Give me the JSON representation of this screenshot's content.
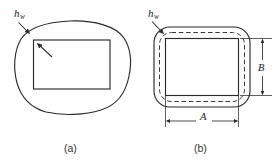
{
  "figure": {
    "type": "engineering-cross-section-diagram",
    "background_color": "#ffffff",
    "line_color": "#2b2b2b",
    "dashed_color": "#3a3a3a",
    "panels": [
      {
        "id": "a",
        "caption": "(a)",
        "description": "Irregular closed outer contour with an inner rectangular cavity; wall thickness annotated",
        "annotations": [
          {
            "name": "wall-thickness",
            "symbol": "h",
            "subscript": "w",
            "text": "h_w",
            "leader": "arrow from label to outer contour, second arrow to inner rectangle corner"
          }
        ],
        "shapes": [
          {
            "name": "outer-contour",
            "style": "solid",
            "form": "irregular-rounded-blob"
          },
          {
            "name": "inner-cavity",
            "style": "solid",
            "form": "rectangle"
          }
        ]
      },
      {
        "id": "b",
        "caption": "(b)",
        "description": "Idealized rounded rectangle outer contour with dashed mid-wall line and inner rectangular cavity; dimensions A and B annotated",
        "annotations": [
          {
            "name": "wall-thickness",
            "symbol": "h",
            "subscript": "w",
            "text": "h_w",
            "leader": "arrow from label to corner wall between outer solid and dashed line"
          }
        ],
        "shapes": [
          {
            "name": "outer-contour",
            "style": "solid",
            "form": "rounded-rectangle"
          },
          {
            "name": "midline-contour",
            "style": "dashed",
            "form": "rounded-rectangle"
          },
          {
            "name": "inner-cavity",
            "style": "solid",
            "form": "rectangle"
          }
        ],
        "dimensions": [
          {
            "name": "width-dimension",
            "label": "A",
            "orientation": "horizontal",
            "position": "below"
          },
          {
            "name": "height-dimension",
            "label": "B",
            "orientation": "vertical",
            "position": "right"
          }
        ]
      }
    ],
    "labels": {
      "hw_symbol": "h",
      "hw_subscript": "w",
      "dim_a": "A",
      "dim_b": "B",
      "caption_a": "(a)",
      "caption_b": "(b)"
    }
  }
}
